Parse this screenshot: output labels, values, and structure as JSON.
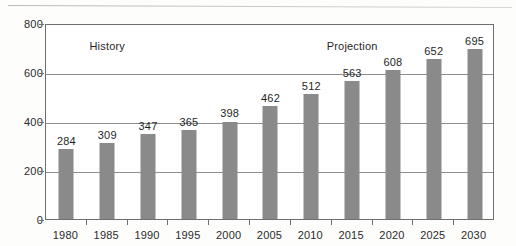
{
  "chart_data": {
    "type": "bar",
    "title": "",
    "subtitle": "",
    "xlabel": "",
    "ylabel": "",
    "categories": [
      "1980",
      "1985",
      "1990",
      "1995",
      "2000",
      "2005",
      "2010",
      "2015",
      "2020",
      "2025",
      "2030"
    ],
    "values": [
      284,
      309,
      347,
      365,
      398,
      462,
      512,
      563,
      608,
      652,
      695
    ],
    "series": [
      {
        "name": "",
        "values": [
          284,
          309,
          347,
          365,
          398,
          462,
          512,
          563,
          608,
          652,
          695
        ]
      }
    ],
    "ylim": [
      0,
      800
    ],
    "yticks": [
      0,
      200,
      400,
      600,
      800
    ],
    "ytick_labels": [
      "0",
      "200",
      "400",
      "600",
      "800"
    ],
    "grid": "horizontal",
    "gridlines_at": [
      200,
      400,
      600
    ],
    "legend": "none",
    "data_labels": true,
    "bar_color": "#8a8a8a",
    "axis_color": "#6f6f6f",
    "grid_color": "#8d8d8d",
    "background_color": "#ffffff",
    "annotations": [
      {
        "text": "History",
        "x_category": "1985",
        "y_value": 740
      },
      {
        "text": "Projection",
        "x_category": "2015",
        "y_value": 740
      }
    ]
  }
}
